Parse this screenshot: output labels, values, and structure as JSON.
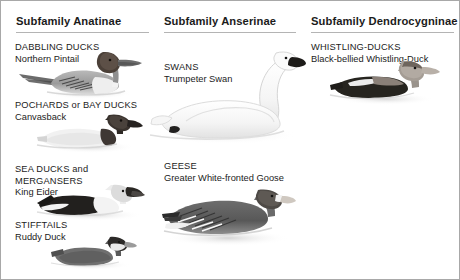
{
  "plate": {
    "background": "#ffffff",
    "border_color": "#a8a8a8",
    "rule_color": "#b4b4b4",
    "text_color": "#1c1c1c"
  },
  "columns": [
    {
      "id": "anatinae",
      "heading": "Subfamily Anatinae",
      "groups": [
        {
          "id": "dabbling-ducks",
          "common": "DABBLING DUCKS",
          "species": "Northern Pintail"
        },
        {
          "id": "pochards",
          "common": "POCHARDS or BAY DUCKS",
          "species": "Canvasback"
        },
        {
          "id": "sea-ducks",
          "common_line1": "SEA DUCKS and",
          "common_line2": "MERGANSERS",
          "species": "King Eider"
        },
        {
          "id": "stifftails",
          "common": "STIFFTAILS",
          "species": "Ruddy Duck"
        }
      ]
    },
    {
      "id": "anserinae",
      "heading": "Subfamily Anserinae",
      "groups": [
        {
          "id": "swans",
          "common": "SWANS",
          "species": "Trumpeter Swan"
        },
        {
          "id": "geese",
          "common": "GEESE",
          "species": "Greater White-fronted Goose"
        }
      ]
    },
    {
      "id": "dendrocygninae",
      "heading": "Subfamily Dendrocygninae",
      "groups": [
        {
          "id": "whistling-ducks",
          "common": "WHISTLING-DUCKS",
          "species": "Black-bellied Whistling-Duck"
        }
      ]
    }
  ],
  "illustrations": [
    {
      "id": "northern-pintail",
      "subject": "northern-pintail-illustration"
    },
    {
      "id": "canvasback",
      "subject": "canvasback-illustration"
    },
    {
      "id": "king-eider",
      "subject": "king-eider-illustration"
    },
    {
      "id": "ruddy-duck",
      "subject": "ruddy-duck-illustration"
    },
    {
      "id": "trumpeter-swan",
      "subject": "trumpeter-swan-illustration"
    },
    {
      "id": "greater-white-fronted-goose",
      "subject": "greater-white-fronted-goose-illustration"
    },
    {
      "id": "black-bellied-whistling-duck",
      "subject": "black-bellied-whistling-duck-illustration"
    }
  ]
}
